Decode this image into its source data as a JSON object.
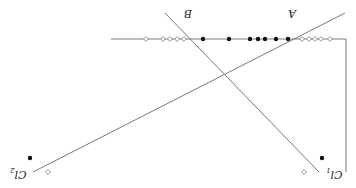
{
  "diagram": {
    "orientation": "rotated-180",
    "colors": {
      "line": "#7a7a7a",
      "filled_marker": "#111111",
      "hollow_marker": "#888888",
      "background": "#ffffff"
    },
    "labels": {
      "A": "A",
      "B": "B",
      "cl1_main": "Cl",
      "cl1_sub": "1",
      "cl2_main": "Cl",
      "cl2_sub": "2"
    },
    "axis_line": {
      "x1": 111,
      "y1": 39,
      "x2": 346,
      "y2": 39
    },
    "right_bracket": {
      "x1": 346,
      "y1": 39,
      "x2": 346,
      "y2": 172
    },
    "line_B": {
      "x1": 165,
      "y1": 13,
      "x2": 319,
      "y2": 172
    },
    "line_C": {
      "x1": 33,
      "y1": 172,
      "x2": 345,
      "y2": 13
    },
    "filled_points_on_axis": [
      203,
      229,
      250,
      258,
      265,
      276,
      288
    ],
    "hollow_points_on_axis": [
      146,
      163,
      170,
      177,
      184,
      302,
      309,
      315,
      321,
      330
    ],
    "cl1_markers": {
      "filled": {
        "x": 322,
        "y": 158
      },
      "hollow": {
        "x": 304,
        "y": 172
      }
    },
    "cl2_markers": {
      "filled": {
        "x": 30,
        "y": 158
      },
      "hollow": {
        "x": 48,
        "y": 172
      }
    }
  }
}
